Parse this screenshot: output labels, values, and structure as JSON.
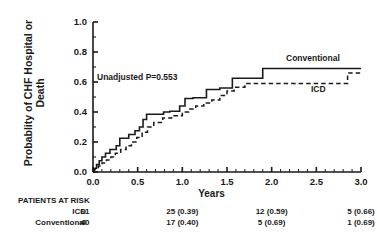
{
  "chart_data": {
    "type": "line",
    "title": "",
    "xlabel": "Years",
    "ylabel": "Probablity of CHF Hospital\nor Death",
    "xlim": [
      0.0,
      3.0
    ],
    "ylim": [
      0.0,
      1.0
    ],
    "xticks": [
      "0.0",
      "0.5",
      "1.0",
      "1.5",
      "2.0",
      "2.5",
      "3.0"
    ],
    "xtick_values": [
      0.0,
      0.5,
      1.0,
      1.5,
      2.0,
      2.5,
      3.0
    ],
    "yticks": [
      "0.0",
      "0.2",
      "0.4",
      "0.6",
      "0.8",
      "1.0"
    ],
    "ytick_values": [
      0.0,
      0.2,
      0.4,
      0.6,
      0.8,
      1.0
    ],
    "grid": false,
    "legend_position": "inline-right",
    "annotation": "Unadjusted P=0.553",
    "series": [
      {
        "name": "Conventional",
        "style": "solid",
        "label_x": 2.15,
        "label_y": 0.76,
        "points": [
          [
            0.0,
            0.0
          ],
          [
            0.02,
            0.025
          ],
          [
            0.04,
            0.025
          ],
          [
            0.04,
            0.05
          ],
          [
            0.07,
            0.05
          ],
          [
            0.07,
            0.075
          ],
          [
            0.1,
            0.075
          ],
          [
            0.1,
            0.1
          ],
          [
            0.14,
            0.1
          ],
          [
            0.14,
            0.125
          ],
          [
            0.19,
            0.125
          ],
          [
            0.19,
            0.15
          ],
          [
            0.26,
            0.15
          ],
          [
            0.26,
            0.175
          ],
          [
            0.3,
            0.175
          ],
          [
            0.3,
            0.225
          ],
          [
            0.4,
            0.225
          ],
          [
            0.4,
            0.25
          ],
          [
            0.47,
            0.25
          ],
          [
            0.47,
            0.275
          ],
          [
            0.52,
            0.275
          ],
          [
            0.52,
            0.3
          ],
          [
            0.56,
            0.3
          ],
          [
            0.56,
            0.35
          ],
          [
            0.6,
            0.35
          ],
          [
            0.6,
            0.385
          ],
          [
            0.79,
            0.385
          ],
          [
            0.79,
            0.4
          ],
          [
            0.86,
            0.4
          ],
          [
            0.86,
            0.405
          ],
          [
            0.97,
            0.405
          ],
          [
            0.97,
            0.44
          ],
          [
            1.03,
            0.44
          ],
          [
            1.03,
            0.49
          ],
          [
            1.12,
            0.49
          ],
          [
            1.12,
            0.495
          ],
          [
            1.27,
            0.495
          ],
          [
            1.27,
            0.55
          ],
          [
            1.42,
            0.55
          ],
          [
            1.42,
            0.56
          ],
          [
            1.56,
            0.56
          ],
          [
            1.56,
            0.625
          ],
          [
            1.9,
            0.625
          ],
          [
            1.9,
            0.69
          ],
          [
            3.0,
            0.69
          ]
        ]
      },
      {
        "name": "ICD",
        "style": "dashed",
        "label_x": 2.42,
        "label_y": 0.545,
        "points": [
          [
            0.0,
            0.0
          ],
          [
            0.03,
            0.02
          ],
          [
            0.06,
            0.02
          ],
          [
            0.06,
            0.04
          ],
          [
            0.1,
            0.04
          ],
          [
            0.1,
            0.06
          ],
          [
            0.15,
            0.06
          ],
          [
            0.15,
            0.08
          ],
          [
            0.2,
            0.08
          ],
          [
            0.2,
            0.1
          ],
          [
            0.25,
            0.1
          ],
          [
            0.25,
            0.125
          ],
          [
            0.31,
            0.125
          ],
          [
            0.31,
            0.15
          ],
          [
            0.37,
            0.15
          ],
          [
            0.37,
            0.175
          ],
          [
            0.43,
            0.175
          ],
          [
            0.43,
            0.2
          ],
          [
            0.49,
            0.2
          ],
          [
            0.49,
            0.23
          ],
          [
            0.55,
            0.23
          ],
          [
            0.55,
            0.265
          ],
          [
            0.61,
            0.265
          ],
          [
            0.61,
            0.3
          ],
          [
            0.68,
            0.3
          ],
          [
            0.68,
            0.33
          ],
          [
            0.78,
            0.33
          ],
          [
            0.78,
            0.36
          ],
          [
            0.88,
            0.36
          ],
          [
            0.88,
            0.375
          ],
          [
            1.0,
            0.375
          ],
          [
            1.0,
            0.4
          ],
          [
            1.07,
            0.4
          ],
          [
            1.07,
            0.42
          ],
          [
            1.15,
            0.42
          ],
          [
            1.15,
            0.44
          ],
          [
            1.24,
            0.44
          ],
          [
            1.24,
            0.46
          ],
          [
            1.33,
            0.46
          ],
          [
            1.33,
            0.48
          ],
          [
            1.42,
            0.48
          ],
          [
            1.42,
            0.51
          ],
          [
            1.5,
            0.51
          ],
          [
            1.5,
            0.54
          ],
          [
            1.58,
            0.54
          ],
          [
            1.58,
            0.565
          ],
          [
            1.7,
            0.565
          ],
          [
            1.7,
            0.59
          ],
          [
            2.85,
            0.59
          ],
          [
            2.85,
            0.66
          ],
          [
            3.0,
            0.66
          ]
        ]
      }
    ]
  },
  "risk_table": {
    "title": "PATIENTS AT RISK",
    "column_positions": [
      0.0,
      1.0,
      2.0,
      3.0
    ],
    "rows": [
      {
        "name": "ICD",
        "cells": [
          "61",
          "25 (0.39)",
          "12 (0.59)",
          "5 (0.66)"
        ]
      },
      {
        "name": "Conventional",
        "cells": [
          "40",
          "17 (0.40)",
          "5 (0.69)",
          "1 (0.69)"
        ]
      }
    ]
  },
  "style": {
    "line_color": "#1a1a1a",
    "axis_color": "#1a1a1a",
    "background": "#ffffff"
  }
}
